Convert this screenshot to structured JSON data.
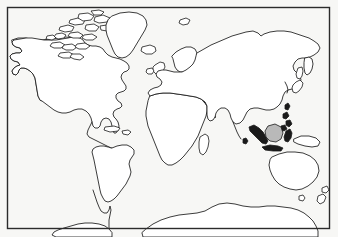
{
  "figure": {
    "kind": "world-map-outline",
    "projection_hint": "rectangular equirectangular-style world outline",
    "has_labels": false,
    "has_graticule": false,
    "visible_text": []
  },
  "canvas": {
    "width": 338,
    "height": 237
  },
  "colors": {
    "background": "#fbfbfa",
    "paper": "#f7f7f5",
    "coastline": "#1a1a1a",
    "frame": "#2b2b2b",
    "land_fill": "#ffffff",
    "inked_island_fill": "#1a1a1a",
    "shaded_island_fill": "#b9b9b9"
  },
  "frame": {
    "name": "map-border",
    "x": 7.5,
    "y": 7.5,
    "width": 322,
    "height": 221,
    "stroke_width": 1.4
  },
  "landmasses": [
    {
      "id": "north-america",
      "label": "North America",
      "style": "outline"
    },
    {
      "id": "alaska",
      "label": "Alaska",
      "style": "outline"
    },
    {
      "id": "canadian-arctic-archipelago",
      "label": "Canadian Arctic Archipelago",
      "style": "outline"
    },
    {
      "id": "greenland",
      "label": "Greenland",
      "style": "outline"
    },
    {
      "id": "iceland",
      "label": "Iceland",
      "style": "outline"
    },
    {
      "id": "central-america",
      "label": "Central America",
      "style": "outline"
    },
    {
      "id": "cuba",
      "label": "Cuba",
      "style": "outline"
    },
    {
      "id": "hispaniola",
      "label": "Hispaniola",
      "style": "outline"
    },
    {
      "id": "south-america",
      "label": "South America",
      "style": "outline"
    },
    {
      "id": "europe",
      "label": "Europe",
      "style": "outline"
    },
    {
      "id": "british-isles",
      "label": "British Isles",
      "style": "outline"
    },
    {
      "id": "ireland",
      "label": "Ireland",
      "style": "outline"
    },
    {
      "id": "scandinavia",
      "label": "Scandinavia",
      "style": "outline"
    },
    {
      "id": "svalbard",
      "label": "Svalbard",
      "style": "outline"
    },
    {
      "id": "africa",
      "label": "Africa",
      "style": "outline"
    },
    {
      "id": "madagascar",
      "label": "Madagascar",
      "style": "outline"
    },
    {
      "id": "arabian-peninsula",
      "label": "Arabian Peninsula",
      "style": "outline"
    },
    {
      "id": "asia",
      "label": "Asia",
      "style": "outline"
    },
    {
      "id": "india",
      "label": "India",
      "style": "outline"
    },
    {
      "id": "sri-lanka",
      "label": "Sri Lanka",
      "style": "inked"
    },
    {
      "id": "kamchatka",
      "label": "Kamchatka",
      "style": "outline"
    },
    {
      "id": "sakhalin",
      "label": "Sakhalin",
      "style": "outline"
    },
    {
      "id": "japan",
      "label": "Japan",
      "style": "outline"
    },
    {
      "id": "korea",
      "label": "Korean Peninsula",
      "style": "outline"
    },
    {
      "id": "taiwan",
      "label": "Taiwan",
      "style": "inked"
    },
    {
      "id": "philippines",
      "label": "Philippines",
      "style": "inked"
    },
    {
      "id": "sumatra",
      "label": "Sumatra",
      "style": "inked"
    },
    {
      "id": "borneo",
      "label": "Borneo",
      "style": "shaded"
    },
    {
      "id": "java",
      "label": "Java",
      "style": "inked"
    },
    {
      "id": "sulawesi",
      "label": "Sulawesi",
      "style": "inked"
    },
    {
      "id": "new-guinea",
      "label": "New Guinea",
      "style": "outline"
    },
    {
      "id": "australia",
      "label": "Australia",
      "style": "outline"
    },
    {
      "id": "tasmania",
      "label": "Tasmania",
      "style": "outline"
    },
    {
      "id": "new-zealand-north",
      "label": "New Zealand North Island",
      "style": "outline"
    },
    {
      "id": "new-zealand-south",
      "label": "New Zealand South Island",
      "style": "outline"
    },
    {
      "id": "antarctica",
      "label": "Antarctica",
      "style": "outline"
    },
    {
      "id": "antarctic-peninsula",
      "label": "Antarctic Peninsula",
      "style": "outline"
    }
  ]
}
